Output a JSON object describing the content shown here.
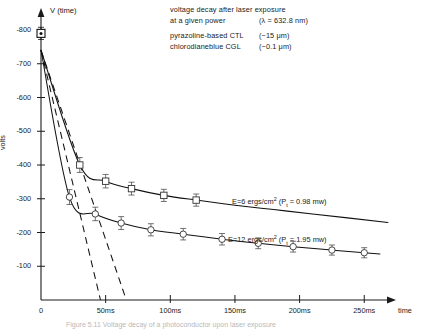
{
  "header": {
    "line1": "voltage decay after laser exposure",
    "line2": "at a given power",
    "wavelength": "(λ = 632.8 nm)",
    "line3": "pyrazoline-based CTL",
    "thickness3": "(~15 μm)",
    "line4": "chlorodianeblue CGL",
    "thickness4": "(~0.1 μm)"
  },
  "axes": {
    "y_title": "V (time)",
    "y_label": "volts",
    "x_label": "time",
    "y_ticks": [
      "-800",
      "-700",
      "-600",
      "-500",
      "-400",
      "-300",
      "-200",
      "-100"
    ],
    "x_ticks": [
      "0",
      "50ms",
      "100ms",
      "150ms",
      "200ms",
      "250ms"
    ]
  },
  "curve_labels": {
    "upper_pre": "E=6 ergs/cm",
    "upper_sup": "2",
    "upper_mid": " (P",
    "upper_sub": "t",
    "upper_post": " = 0.98 mw)",
    "lower_pre": "E=12 ergs/cm",
    "lower_sup": "2",
    "lower_mid": " (P",
    "lower_sub": "t",
    "lower_post": " = 1.95 mw)"
  },
  "caption": "Figure 5.11  Voltage decay of a photoconductor upon laser exposure",
  "colors": {
    "ink": "#1a1a1a",
    "curve": "#111111",
    "marker": "#333333"
  },
  "chart_data": {
    "type": "line",
    "xlabel": "time",
    "ylabel": "volts",
    "xlim": [
      0,
      270
    ],
    "ylim": [
      -800,
      0
    ],
    "xunit": "ms",
    "yunit": "volts",
    "grid": false,
    "legend": "inline-annotations",
    "initial_point": {
      "x": 0,
      "y": -790,
      "err": 18
    },
    "series": [
      {
        "name": "E=6 ergs/cm2 (Pt = 0.98 mw)",
        "label": "upper",
        "x": [
          0,
          30,
          50,
          70,
          95,
          120,
          150,
          180,
          210
        ],
        "y": [
          -740,
          -400,
          -352,
          -330,
          -310,
          -296,
          -281,
          -268,
          -255
        ],
        "yerr": [
          0,
          22,
          20,
          19,
          18,
          18,
          17,
          17,
          16
        ],
        "markers_at": [
          30,
          50,
          70,
          95,
          120
        ],
        "tangent": {
          "x0": 0,
          "y0": -740,
          "x1": 66,
          "y1": 0
        }
      },
      {
        "name": "E=12 ergs/cm2 (Pt = 1.95 mw)",
        "label": "lower",
        "x": [
          0,
          22,
          42,
          62,
          85,
          110,
          140,
          168,
          195,
          225,
          250
        ],
        "y": [
          -740,
          -305,
          -255,
          -228,
          -208,
          -195,
          -180,
          -168,
          -158,
          -148,
          -140
        ],
        "yerr": [
          0,
          22,
          20,
          19,
          18,
          17,
          17,
          16,
          16,
          15,
          15
        ],
        "markers_at": [
          22,
          42,
          62,
          85,
          110,
          140,
          168,
          195,
          225,
          250
        ],
        "tangent": {
          "x0": 0,
          "y0": -740,
          "x1": 46,
          "y1": 0
        }
      }
    ]
  }
}
